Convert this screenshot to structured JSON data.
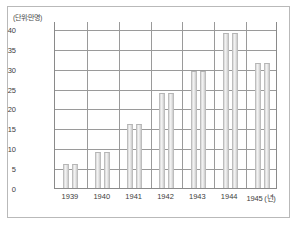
{
  "figure": {
    "unit_label": "(단위:만명)",
    "x_axis_suffix": "(년)"
  },
  "chart_data": {
    "type": "bar",
    "title": "",
    "subtitle": "",
    "xlabel": "(년)",
    "ylabel": "(단위:만명)",
    "categories": [
      "1939",
      "1940",
      "1941",
      "1942",
      "1943",
      "1944",
      "1945"
    ],
    "x_tick_labels": [
      "1939",
      "1940",
      "1941",
      "1942",
      "1943",
      "1944",
      "1945 (년)"
    ],
    "values": [
      6,
      9,
      16,
      24,
      29.5,
      39,
      31.5
    ],
    "bars_per_category": 2,
    "ylim": [
      0,
      42
    ],
    "yticks": [
      0,
      5,
      10,
      15,
      20,
      25,
      30,
      35,
      40
    ],
    "ytick_labels": [
      "0",
      "5",
      "10",
      "15",
      "20",
      "25",
      "30",
      "35",
      "40"
    ],
    "grid": "horizontal-and-category-separators",
    "legend": "none",
    "bar_color": "#e2e2e2",
    "axis_color": "#8a8a8a",
    "grid_color": "#9a9a9a",
    "text_color": "#3d3d3d",
    "background": "#ffffff"
  }
}
